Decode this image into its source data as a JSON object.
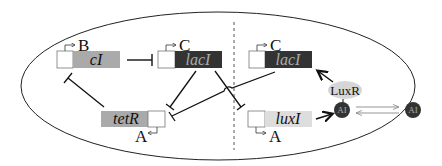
{
  "diagram": {
    "type": "genetic-circuit",
    "colors": {
      "cell_outline": "#222222",
      "promoter_fill": "#ffffff",
      "gene_cI": "#aaaaaa",
      "gene_lacI": "#333333",
      "gene_tetR": "#aaaaaa",
      "gene_luxI": "#dddddd",
      "luxR_fill": "#d6d6d6",
      "ai_fill": "#333333",
      "arrow_gray": "#999999"
    },
    "genes": [
      {
        "id": "cI",
        "label": "cI",
        "promoter_label": "B"
      },
      {
        "id": "lacI_left",
        "label": "lacI",
        "promoter_label": "C"
      },
      {
        "id": "lacI_right",
        "label": "lacI",
        "promoter_label": "C"
      },
      {
        "id": "tetR",
        "label": "tetR",
        "promoter_label": "A"
      },
      {
        "id": "luxI",
        "label": "luxI",
        "promoter_label": "A"
      }
    ],
    "proteins": {
      "luxR": "LuxR",
      "ai_inside": "AI",
      "ai_outside": "AI"
    },
    "interactions": [
      {
        "from": "cI",
        "to": "lacI_left",
        "type": "repression"
      },
      {
        "from": "lacI_left",
        "to": "tetR",
        "type": "repression"
      },
      {
        "from": "lacI_left",
        "to": "luxI",
        "type": "repression"
      },
      {
        "from": "lacI_right",
        "to": "tetR",
        "type": "repression"
      },
      {
        "from": "tetR",
        "to": "cI",
        "type": "repression"
      },
      {
        "from": "luxI",
        "to": "AI",
        "type": "activation"
      },
      {
        "from": "LuxR-AI",
        "to": "lacI_right",
        "type": "activation"
      },
      {
        "from": "AI_inside",
        "to": "AI_outside",
        "type": "diffusion"
      }
    ]
  }
}
